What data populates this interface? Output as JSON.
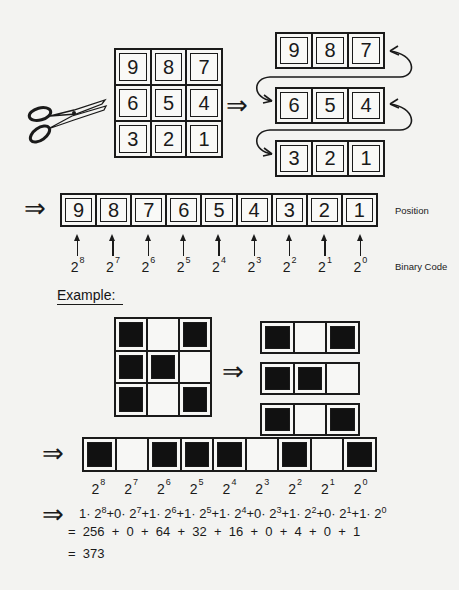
{
  "diagram": {
    "step1": {
      "icon": "scissors-icon",
      "grid": [
        [
          "9",
          "8",
          "7"
        ],
        [
          "6",
          "5",
          "4"
        ],
        [
          "3",
          "2",
          "1"
        ]
      ],
      "cut_rows": [
        [
          "9",
          "8",
          "7"
        ],
        [
          "6",
          "5",
          "4"
        ],
        [
          "3",
          "2",
          "1"
        ]
      ],
      "arrow": "⇒"
    },
    "position_strip": {
      "arrow": "⇒",
      "cells": [
        "9",
        "8",
        "7",
        "6",
        "5",
        "4",
        "3",
        "2",
        "1"
      ],
      "position_label": "Position",
      "binary_code_label": "Binary Code",
      "powers": [
        {
          "base": "2",
          "exp": "8"
        },
        {
          "base": "2",
          "exp": "7"
        },
        {
          "base": "2",
          "exp": "6"
        },
        {
          "base": "2",
          "exp": "5"
        },
        {
          "base": "2",
          "exp": "4"
        },
        {
          "base": "2",
          "exp": "3"
        },
        {
          "base": "2",
          "exp": "2"
        },
        {
          "base": "2",
          "exp": "1"
        },
        {
          "base": "2",
          "exp": "0"
        }
      ]
    },
    "example": {
      "heading": "Example:",
      "grid": [
        [
          1,
          0,
          1
        ],
        [
          1,
          1,
          0
        ],
        [
          1,
          0,
          1
        ]
      ],
      "rows": [
        [
          1,
          0,
          1
        ],
        [
          1,
          1,
          0
        ],
        [
          1,
          0,
          1
        ]
      ],
      "arrow": "⇒",
      "strip": [
        1,
        0,
        1,
        1,
        1,
        0,
        1,
        0,
        1
      ],
      "strip_arrow": "⇒",
      "powers": [
        {
          "base": "2",
          "exp": "8"
        },
        {
          "base": "2",
          "exp": "7"
        },
        {
          "base": "2",
          "exp": "6"
        },
        {
          "base": "2",
          "exp": "5"
        },
        {
          "base": "2",
          "exp": "4"
        },
        {
          "base": "2",
          "exp": "3"
        },
        {
          "base": "2",
          "exp": "2"
        },
        {
          "base": "2",
          "exp": "1"
        },
        {
          "base": "2",
          "exp": "0"
        }
      ],
      "formula_arrow": "⇒",
      "formula_terms": [
        {
          "coef": "1",
          "exp": "8"
        },
        {
          "coef": "0",
          "exp": "7"
        },
        {
          "coef": "1",
          "exp": "6"
        },
        {
          "coef": "1",
          "exp": "5"
        },
        {
          "coef": "1",
          "exp": "4"
        },
        {
          "coef": "0",
          "exp": "3"
        },
        {
          "coef": "1",
          "exp": "2"
        },
        {
          "coef": "0",
          "exp": "1"
        },
        {
          "coef": "1",
          "exp": "0"
        }
      ],
      "sum_line": "=  256  +  0  +  64  +  32  +  16  +  0  +  4  +  0  +  1",
      "result_line": "=  373"
    },
    "colors": {
      "background": "#f3f3f1",
      "ink": "#1a1a1a",
      "filled_cell": "#111111"
    }
  }
}
